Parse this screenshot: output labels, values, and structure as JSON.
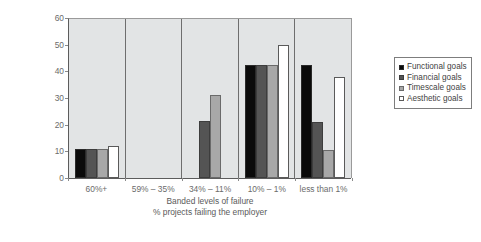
{
  "chart_data": {
    "type": "bar",
    "title": "",
    "categories": [
      "60%+",
      "59% – 35%",
      "34% – 11%",
      "10% – 1%",
      "less than 1%"
    ],
    "series": [
      {
        "name": "Functional goals",
        "color": "#0a0a0a",
        "values": [
          11,
          0,
          0,
          42.5,
          42.5
        ]
      },
      {
        "name": "Financial goals",
        "color": "#545454",
        "values": [
          11,
          0,
          21.5,
          42.5,
          21
        ]
      },
      {
        "name": "Timescale goals",
        "color": "#a8a8a8",
        "values": [
          11,
          0,
          31,
          42.5,
          10.5
        ]
      },
      {
        "name": "Aesthetic goals",
        "color": "#ffffff",
        "values": [
          12,
          0,
          0,
          50,
          38
        ]
      }
    ],
    "xlabel": "Banded levels of failure",
    "xlabel_sub": "% projects failing the employer",
    "ylabel_line1": "Proportional % of Developer's",
    "ylabel_line2": "Experiences",
    "ylim": [
      0,
      60
    ],
    "yticks": [
      0,
      10,
      20,
      30,
      40,
      50,
      60
    ],
    "ytick_labels": [
      "0",
      "10",
      "20",
      "30",
      "40",
      "50",
      "60"
    ],
    "grid": false,
    "legend_position": "right",
    "plot_background": "#e2e4e5",
    "axis_color": "#5c5c5c"
  }
}
